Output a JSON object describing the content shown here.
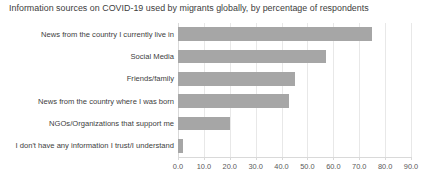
{
  "chart_data": {
    "type": "bar",
    "orientation": "horizontal",
    "title": "Information sources on COVID-19 used by migrants globally, by percentage of respondents",
    "xlabel": "",
    "ylabel": "",
    "categories": [
      "News from the country I currently live in",
      "Social Media",
      "Friends/family",
      "News from the country where I was born",
      "NGOs/Organizations that support me",
      "I don't have any information I trust/I understand"
    ],
    "values": [
      75,
      57,
      45,
      43,
      20,
      2
    ],
    "xlim": [
      0,
      90
    ],
    "xticks": [
      0,
      10,
      20,
      30,
      40,
      50,
      60,
      70,
      80,
      90
    ],
    "xtick_labels": [
      "0.0",
      "10.0",
      "20.0",
      "30.0",
      "40.0",
      "50.0",
      "60.0",
      "70.0",
      "80.0",
      "90.0"
    ],
    "grid": true,
    "grid_axis": "x",
    "legend": false,
    "bar_color": "#a6a6a6",
    "gridline_color": "#e8e8e8",
    "axis_color": "#d9d9d9",
    "title_color": "#3d3d3d",
    "label_color": "#404040"
  }
}
